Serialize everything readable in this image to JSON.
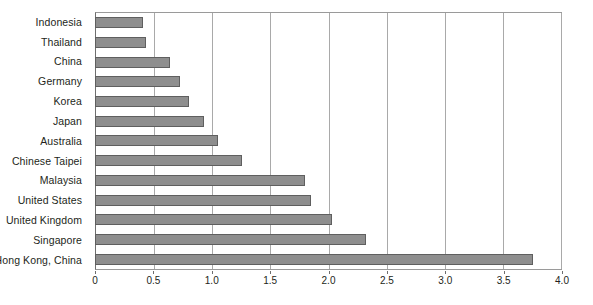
{
  "chart_data": {
    "type": "bar",
    "orientation": "horizontal",
    "title": "",
    "subtitle": "",
    "xlabel": "",
    "ylabel": "",
    "xlim": [
      0,
      4.0
    ],
    "xticks": [
      "0",
      "0.5",
      "1.0",
      "1.5",
      "2.0",
      "2.5",
      "3.0",
      "3.5",
      "4.0"
    ],
    "xtick_values": [
      0,
      0.5,
      1.0,
      1.5,
      2.0,
      2.5,
      3.0,
      3.5,
      4.0
    ],
    "grid": "vertical",
    "legend": "none",
    "bar_color": "#8e8e8e",
    "bar_border_color": "#5f5f5f",
    "gridline_color": "#a9a9a9",
    "axis_color": "#6e6e6e",
    "categories": [
      "Indonesia",
      "Thailand",
      "China",
      "Germany",
      "Korea",
      "Japan",
      "Australia",
      "Chinese Taipei",
      "Malaysia",
      "United States",
      "United Kingdom",
      "Singapore",
      "Hong Kong, China"
    ],
    "values": [
      0.4,
      0.43,
      0.64,
      0.72,
      0.8,
      0.93,
      1.05,
      1.26,
      1.8,
      1.85,
      2.03,
      2.32,
      3.76
    ]
  }
}
